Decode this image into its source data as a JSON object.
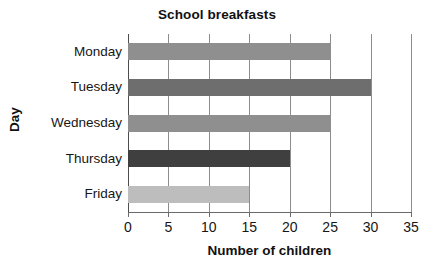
{
  "chart_data": {
    "type": "bar",
    "orientation": "horizontal",
    "title": "School breakfasts",
    "xlabel": "Number of children",
    "ylabel": "Day",
    "categories": [
      "Monday",
      "Tuesday",
      "Wednesday",
      "Thursday",
      "Friday"
    ],
    "values": [
      25,
      30,
      25,
      20,
      15
    ],
    "xlim": [
      0,
      35
    ],
    "xticks": [
      0,
      5,
      10,
      15,
      20,
      25,
      30,
      35
    ],
    "xtick_labels": [
      "0",
      "5",
      "10",
      "15",
      "20",
      "25",
      "30",
      "35"
    ],
    "grid": true,
    "grid_axis": "x",
    "legend": false,
    "bar_colors": [
      "#8f8f8f",
      "#6e6e6e",
      "#8f8f8f",
      "#3f3f3f",
      "#bdbdbd"
    ],
    "series": [
      {
        "name": "Number of children",
        "values": [
          25,
          30,
          25,
          20,
          15
        ]
      }
    ],
    "bars": [
      {
        "category": "Monday",
        "value": 25,
        "color": "#8f8f8f"
      },
      {
        "category": "Tuesday",
        "value": 30,
        "color": "#6e6e6e"
      },
      {
        "category": "Wednesday",
        "value": 25,
        "color": "#8f8f8f"
      },
      {
        "category": "Thursday",
        "value": 20,
        "color": "#3f3f3f"
      },
      {
        "category": "Friday",
        "value": 15,
        "color": "#bdbdbd"
      }
    ]
  },
  "style": {
    "gridline_color": "#8d8d8d",
    "axis_color": "#6a6a6a",
    "text_color": "#161616",
    "background": "#ffffff"
  }
}
